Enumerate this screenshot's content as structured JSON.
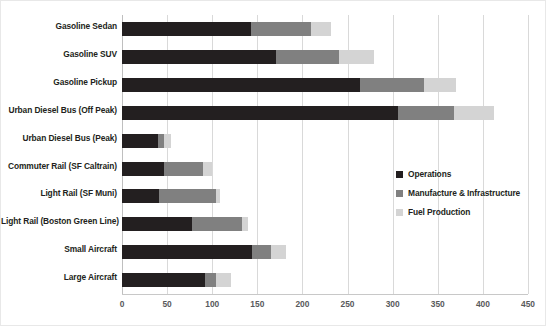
{
  "chart_data": {
    "type": "bar",
    "orientation": "horizontal",
    "stacked": true,
    "title": "",
    "xlabel": "",
    "ylabel": "",
    "xlim": [
      0,
      450
    ],
    "xticks": [
      "0",
      "50",
      "100",
      "150",
      "200",
      "250",
      "300",
      "350",
      "400",
      "450"
    ],
    "grid": true,
    "legend_position": "right-middle",
    "categories": [
      "Gasoline Sedan",
      "Gasoline SUV",
      "Gasoline Pickup",
      "Urban Diesel Bus (Off Peak)",
      "Urban Diesel Bus (Peak)",
      "Commuter Rail (SF Caltrain)",
      "Light Rail (SF Muni)",
      "Light Rail (Boston Green Line)",
      "Small Aircraft",
      "Large Aircraft"
    ],
    "series": [
      {
        "name": "Operations",
        "color": "#231f20",
        "values": [
          143,
          171,
          264,
          306,
          40,
          47,
          41,
          78,
          144,
          92
        ]
      },
      {
        "name": "Manufacture & Infrastructure",
        "color": "#808080",
        "values": [
          67,
          69,
          71,
          62,
          7,
          43,
          63,
          55,
          21,
          12
        ]
      },
      {
        "name": "Fuel Production",
        "color": "#d4d4d4",
        "values": [
          22,
          39,
          35,
          44,
          7,
          10,
          5,
          7,
          17,
          17
        ]
      }
    ],
    "totals": [
      232,
      279,
      370,
      412,
      54,
      100,
      109,
      140,
      182,
      121
    ]
  }
}
